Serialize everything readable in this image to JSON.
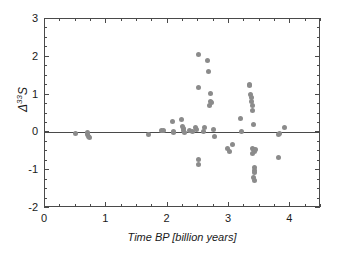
{
  "chart_data": {
    "type": "scatter",
    "title": "",
    "xlabel": "Time BP [billion years]",
    "ylabel": "Δ33S",
    "ylabel_base": "Δ",
    "ylabel_sup": "33",
    "ylabel_tail": "S",
    "xlim": [
      0,
      4.5
    ],
    "ylim": [
      -2,
      3
    ],
    "xticks": [
      0,
      1,
      2,
      3,
      4
    ],
    "yticks": [
      -2,
      -1,
      0,
      1,
      2,
      3
    ],
    "xtick_labels": [
      "0",
      "1",
      "2",
      "3",
      "4"
    ],
    "ytick_labels": [
      "-2",
      "-1",
      "0",
      "1",
      "2",
      "3"
    ],
    "x_minor_step": 0.25,
    "y_minor_step": 0.25,
    "grid": false,
    "legend": null,
    "reference_line_y": 0,
    "marker_color": "#8b8b8b",
    "axis_color": "#4a4a4a",
    "marker_size_px": 5,
    "n_points": 62,
    "points": [
      {
        "x": 0.5,
        "y": -0.02
      },
      {
        "x": 0.7,
        "y": 0.0
      },
      {
        "x": 0.7,
        "y": -0.05
      },
      {
        "x": 0.71,
        "y": -0.1
      },
      {
        "x": 0.72,
        "y": -0.14
      },
      {
        "x": 1.68,
        "y": -0.05
      },
      {
        "x": 1.9,
        "y": 0.04
      },
      {
        "x": 1.93,
        "y": 0.06
      },
      {
        "x": 2.08,
        "y": 0.28
      },
      {
        "x": 2.09,
        "y": 0.03
      },
      {
        "x": 2.1,
        "y": 0.0
      },
      {
        "x": 2.22,
        "y": 0.34
      },
      {
        "x": 2.24,
        "y": 0.15
      },
      {
        "x": 2.25,
        "y": 0.09
      },
      {
        "x": 2.26,
        "y": 0.05
      },
      {
        "x": 2.27,
        "y": 0.0
      },
      {
        "x": 2.35,
        "y": 0.05
      },
      {
        "x": 2.4,
        "y": 0.03
      },
      {
        "x": 2.45,
        "y": 0.14
      },
      {
        "x": 2.47,
        "y": 0.08
      },
      {
        "x": 2.5,
        "y": 2.05
      },
      {
        "x": 2.5,
        "y": 1.18
      },
      {
        "x": 2.5,
        "y": -0.72
      },
      {
        "x": 2.51,
        "y": -0.85
      },
      {
        "x": 2.58,
        "y": 0.02
      },
      {
        "x": 2.6,
        "y": 0.12
      },
      {
        "x": 2.65,
        "y": 1.9
      },
      {
        "x": 2.67,
        "y": 1.62
      },
      {
        "x": 2.7,
        "y": 1.02
      },
      {
        "x": 2.7,
        "y": 0.83
      },
      {
        "x": 2.69,
        "y": 0.7
      },
      {
        "x": 2.72,
        "y": 0.78
      },
      {
        "x": 2.74,
        "y": 0.08
      },
      {
        "x": 2.76,
        "y": -0.12
      },
      {
        "x": 2.98,
        "y": -0.42
      },
      {
        "x": 3.0,
        "y": -0.5
      },
      {
        "x": 3.05,
        "y": -0.33
      },
      {
        "x": 3.18,
        "y": 0.38
      },
      {
        "x": 3.2,
        "y": 0.03
      },
      {
        "x": 3.33,
        "y": 1.28
      },
      {
        "x": 3.34,
        "y": 1.23
      },
      {
        "x": 3.35,
        "y": 1.0
      },
      {
        "x": 3.36,
        "y": 0.92
      },
      {
        "x": 3.37,
        "y": 0.83
      },
      {
        "x": 3.38,
        "y": 0.72
      },
      {
        "x": 3.39,
        "y": 0.57
      },
      {
        "x": 3.4,
        "y": 0.2
      },
      {
        "x": 3.38,
        "y": -0.42
      },
      {
        "x": 3.4,
        "y": -0.45
      },
      {
        "x": 3.42,
        "y": -0.5
      },
      {
        "x": 3.39,
        "y": -0.56
      },
      {
        "x": 3.44,
        "y": -0.44
      },
      {
        "x": 3.41,
        "y": -0.93
      },
      {
        "x": 3.41,
        "y": -1.0
      },
      {
        "x": 3.42,
        "y": -1.06
      },
      {
        "x": 3.4,
        "y": -1.2
      },
      {
        "x": 3.41,
        "y": -1.28
      },
      {
        "x": 3.8,
        "y": -0.05
      },
      {
        "x": 3.8,
        "y": -0.67
      },
      {
        "x": 3.83,
        "y": -0.03
      },
      {
        "x": 3.9,
        "y": 0.13
      }
    ]
  }
}
